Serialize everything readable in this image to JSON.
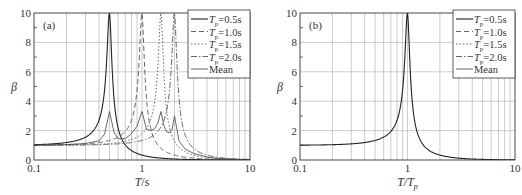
{
  "chart_data": [
    {
      "type": "line",
      "panel_label": "(a)",
      "xlabel": "T/s",
      "ylabel": "β",
      "xscale": "log",
      "xlim": [
        0.1,
        10
      ],
      "ylim": [
        0,
        10
      ],
      "xticks": [
        "0.1",
        "1",
        "10"
      ],
      "yticks": [
        "0",
        "2",
        "4",
        "6",
        "8",
        "10"
      ],
      "grid": true,
      "legend_position": "upper right",
      "legend": [
        "T_p=0.5s",
        "T_p=1.0s",
        "T_p=1.5s",
        "T_p=2.0s",
        "Mean"
      ],
      "series": [
        {
          "name": "T_p=0.5s",
          "style": "solid",
          "Tp": 0.5
        },
        {
          "name": "T_p=1.0s",
          "style": "dashed",
          "Tp": 1.0
        },
        {
          "name": "T_p=1.5s",
          "style": "dotted",
          "Tp": 1.5
        },
        {
          "name": "T_p=2.0s",
          "style": "dashdot",
          "Tp": 2.0
        },
        {
          "name": "Mean",
          "style": "solid-thin",
          "x": [
            0.1,
            0.2,
            0.3,
            0.4,
            0.45,
            0.5,
            0.55,
            0.6,
            0.7,
            0.8,
            0.9,
            1.0,
            1.1,
            1.2,
            1.3,
            1.4,
            1.5,
            1.6,
            1.7,
            1.8,
            1.9,
            2.0,
            2.2,
            2.5,
            3,
            4,
            5,
            7,
            10
          ],
          "y": [
            1.01,
            1.05,
            1.12,
            1.3,
            1.75,
            3.3,
            1.9,
            1.45,
            1.45,
            1.8,
            2.3,
            3.3,
            2.1,
            2.0,
            2.1,
            2.5,
            3.3,
            2.3,
            1.9,
            1.85,
            2.1,
            3.0,
            1.3,
            0.75,
            0.45,
            0.2,
            0.11,
            0.05,
            0.025
          ]
        }
      ],
      "damping_ratio": 0.05
    },
    {
      "type": "line",
      "panel_label": "(b)",
      "xlabel": "T/T_p",
      "ylabel": "β",
      "xscale": "log",
      "xlim": [
        0.1,
        10
      ],
      "ylim": [
        0,
        10
      ],
      "xticks": [
        "0.1",
        "1",
        "10"
      ],
      "yticks": [
        "0",
        "2",
        "4",
        "6",
        "8",
        "10"
      ],
      "grid": true,
      "legend_position": "upper right",
      "legend": [
        "T_p=0.5s",
        "T_p=1.0s",
        "T_p=1.5s",
        "T_p=2.0s",
        "Mean"
      ],
      "series": [
        {
          "name": "All (coincident)",
          "style": "solid",
          "x": [
            0.1,
            0.2,
            0.3,
            0.4,
            0.5,
            0.6,
            0.7,
            0.8,
            0.85,
            0.9,
            0.95,
            1.0,
            1.05,
            1.1,
            1.2,
            1.3,
            1.5,
            2,
            3,
            5,
            7,
            10
          ],
          "y": [
            1.01,
            1.04,
            1.1,
            1.19,
            1.33,
            1.56,
            1.94,
            2.73,
            3.44,
            4.75,
            7.35,
            10,
            6.81,
            4.22,
            2.19,
            1.42,
            0.79,
            0.33,
            0.125,
            0.042,
            0.021,
            0.01
          ]
        }
      ]
    }
  ],
  "panels": {
    "a": {
      "label": "(a)",
      "xlabel_main": "T",
      "xlabel_unit": "/s",
      "ylabel": "β",
      "xticks": [
        "0.1",
        "1",
        "10"
      ],
      "yticks": [
        "0",
        "2",
        "4",
        "6",
        "8",
        "10"
      ]
    },
    "b": {
      "label": "(b)",
      "xlabel_main": "T/T",
      "xlabel_sub": "p",
      "ylabel": "β",
      "xticks": [
        "0.1",
        "1",
        "10"
      ],
      "yticks": [
        "0",
        "2",
        "4",
        "6",
        "8",
        "10"
      ]
    }
  },
  "legend": [
    {
      "pre": "T",
      "sub": "p",
      "post": "=0.5s",
      "style": "solid"
    },
    {
      "pre": "T",
      "sub": "p",
      "post": "=1.0s",
      "style": "dashed"
    },
    {
      "pre": "T",
      "sub": "p",
      "post": "=1.5s",
      "style": "dotted"
    },
    {
      "pre": "T",
      "sub": "p",
      "post": "=2.0s",
      "style": "dashdot"
    },
    {
      "pre": "",
      "sub": "",
      "post": "Mean",
      "style": "solid-thin"
    }
  ]
}
